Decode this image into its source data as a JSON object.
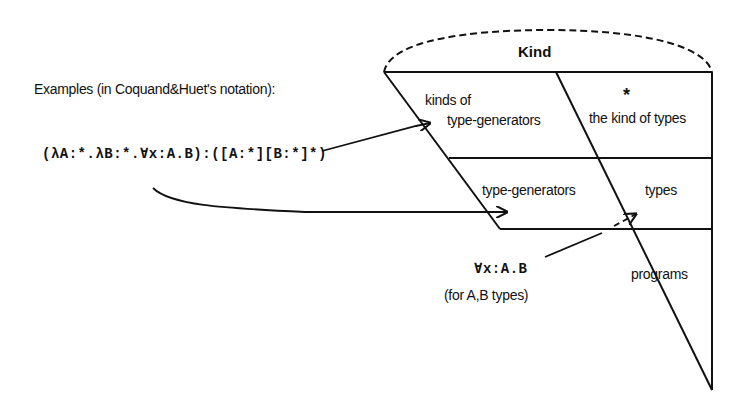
{
  "intro": {
    "heading": "Examples (in Coquand&Huet's notation):",
    "expression": "(λA:*.λB:*.∀x:A.B):([A:*][B:*]*)"
  },
  "diagram": {
    "top_label": "Kind",
    "regions": [
      {
        "id": "kinds-of-type-generators",
        "line1": "kinds of",
        "line2": "type-generators"
      },
      {
        "id": "kind-of-types",
        "symbol": "*",
        "label": "the kind of types"
      },
      {
        "id": "type-generators",
        "label": "type-generators"
      },
      {
        "id": "types",
        "label": "types"
      },
      {
        "id": "programs",
        "label": "programs"
      }
    ],
    "annotation": {
      "expression": "∀x:A.B",
      "note": "(for A,B types)"
    }
  },
  "colors": {
    "line": "#111111",
    "background": "#ffffff"
  }
}
